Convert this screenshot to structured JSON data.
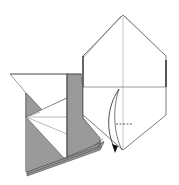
{
  "diagram": {
    "type": "origami-fold-step",
    "colors": {
      "paper_white": "#ffffff",
      "paper_gray": "#9a9a9a",
      "line": "#555555",
      "crease": "#888888",
      "arrow": "#222222"
    },
    "elements": {
      "hexagon_flap": {
        "description": "white folded hexagonal flap with center crease"
      },
      "left_assembly": {
        "description": "gray and white layered base section on the left"
      },
      "fold_arrow": {
        "description": "curved arrow indicating fold down along the crease"
      },
      "fold_mark": {
        "description": "short dashed line marking fold location"
      }
    }
  }
}
